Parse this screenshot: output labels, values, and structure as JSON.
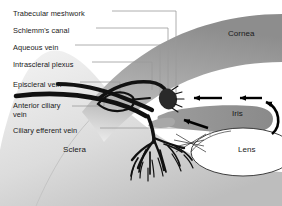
{
  "figure": {
    "background_color": "#ffffff"
  },
  "colors": {
    "vessel": "#111111",
    "cornea": "#9a9a9a",
    "sclera": "#d2d2d2",
    "iris": "#8f8f8f",
    "lens_fill": "#ffffff",
    "lens_stroke": "#2b2b2b",
    "leader_line": "#9b9b9b",
    "text": "#1a1a1a",
    "arrow": "#000000"
  },
  "left_labels": [
    {
      "id": "trabecular-meshwork",
      "text": "Trabecular meshwork",
      "x": 13,
      "y": 10,
      "leader": true
    },
    {
      "id": "schlemms-canal",
      "text": "Schlemm's canal",
      "x": 13,
      "y": 27,
      "leader": true
    },
    {
      "id": "aqueous-vein",
      "text": "Aqueous vein",
      "x": 13,
      "y": 44,
      "leader": true
    },
    {
      "id": "intrascleral-plexus",
      "text": "Intrascleral plexus",
      "x": 13,
      "y": 61,
      "leader": true
    },
    {
      "id": "episcleral-vein",
      "text": "Episcleral vein",
      "x": 13,
      "y": 81,
      "leader": true
    },
    {
      "id": "anterior-ciliary-vein",
      "text": "Anterior ciliary\nvein",
      "x": 13,
      "y": 102,
      "leader": true
    },
    {
      "id": "ciliary-efferent-vein",
      "text": "Ciliary efferent vein",
      "x": 13,
      "y": 127,
      "leader": true
    }
  ],
  "region_labels": [
    {
      "id": "sclera",
      "text": "Sclera",
      "x": 63,
      "y": 146
    },
    {
      "id": "cornea",
      "text": "Cornea",
      "x": 228,
      "y": 30
    },
    {
      "id": "iris",
      "text": "Iris",
      "x": 232,
      "y": 110
    },
    {
      "id": "lens",
      "text": "Lens",
      "x": 238,
      "y": 146
    }
  ],
  "flow_arrows": [
    {
      "id": "arrow-posterior-chamber-to-angle",
      "direction": "left",
      "description": "aqueous flow toward drainage angle"
    },
    {
      "id": "arrow-anterior-chamber-flow",
      "direction": "left",
      "description": "aqueous crossing anterior chamber"
    },
    {
      "id": "arrow-pupil-margin-flow",
      "direction": "curved",
      "description": "aqueous passing through pupil"
    }
  ]
}
